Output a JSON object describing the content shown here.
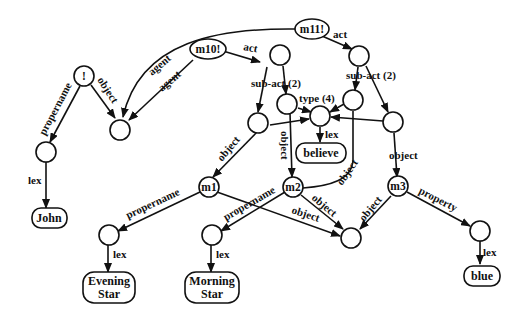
{
  "diagram": {
    "type": "semantic-network",
    "nodes": {
      "bang": {
        "label": "!"
      },
      "m10": {
        "label": "m10!"
      },
      "m11": {
        "label": "m11!"
      },
      "m1": {
        "label": "m1"
      },
      "m2": {
        "label": "m2"
      },
      "m3": {
        "label": "m3"
      }
    },
    "lex_boxes": {
      "john": {
        "label": "John"
      },
      "believe": {
        "label": "believe"
      },
      "evening": {
        "line1": "Evening",
        "line2": "Star"
      },
      "morning": {
        "line1": "Morning",
        "line2": "Star"
      },
      "blue": {
        "label": "blue"
      }
    },
    "edge_labels": {
      "propername": "propername",
      "object": "object",
      "agent": "agent",
      "act": "act",
      "sub_act": "sub-act (2)",
      "type": "type (4)",
      "lex": "lex",
      "property": "property"
    }
  }
}
